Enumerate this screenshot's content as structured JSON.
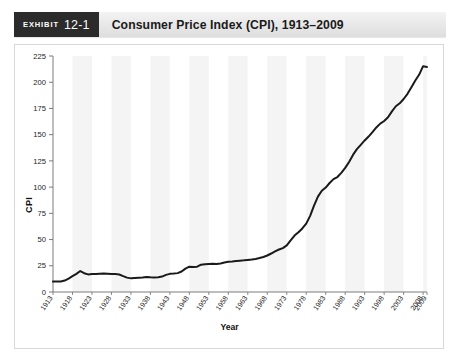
{
  "exhibit": {
    "word": "Exhibit",
    "number": "12-1"
  },
  "header": {
    "title": "Consumer Price Index (CPI), 1913–2009"
  },
  "chart_data": {
    "type": "line",
    "title": "Consumer Price Index (CPI), 1913–2009",
    "xlabel": "Year",
    "ylabel": "CPI",
    "ylim": [
      0,
      225
    ],
    "xlim": [
      1913,
      2009
    ],
    "yticks": [
      0,
      25,
      50,
      75,
      100,
      125,
      150,
      175,
      200,
      225
    ],
    "categories": [
      "1913",
      "1918",
      "1923",
      "1928",
      "1933",
      "1938",
      "1943",
      "1948",
      "1953",
      "1958",
      "1963",
      "1968",
      "1973",
      "1978",
      "1983",
      "1988",
      "1993",
      "1998",
      "2003",
      "2008",
      "2009"
    ],
    "grid": false,
    "legend": false,
    "series": [
      {
        "name": "CPI",
        "color": "#1a1a1a",
        "x": [
          1913,
          1914,
          1915,
          1916,
          1917,
          1918,
          1919,
          1920,
          1921,
          1922,
          1923,
          1924,
          1925,
          1926,
          1927,
          1928,
          1929,
          1930,
          1931,
          1932,
          1933,
          1934,
          1935,
          1936,
          1937,
          1938,
          1939,
          1940,
          1941,
          1942,
          1943,
          1944,
          1945,
          1946,
          1947,
          1948,
          1949,
          1950,
          1951,
          1952,
          1953,
          1954,
          1955,
          1956,
          1957,
          1958,
          1959,
          1960,
          1961,
          1962,
          1963,
          1964,
          1965,
          1966,
          1967,
          1968,
          1969,
          1970,
          1971,
          1972,
          1973,
          1974,
          1975,
          1976,
          1977,
          1978,
          1979,
          1980,
          1981,
          1982,
          1983,
          1984,
          1985,
          1986,
          1987,
          1988,
          1989,
          1990,
          1991,
          1992,
          1993,
          1994,
          1995,
          1996,
          1997,
          1998,
          1999,
          2000,
          2001,
          2002,
          2003,
          2004,
          2005,
          2006,
          2007,
          2008,
          2009
        ],
        "values": [
          9.9,
          10.0,
          10.1,
          10.9,
          12.8,
          15.1,
          17.3,
          20.0,
          17.9,
          16.8,
          17.1,
          17.1,
          17.5,
          17.7,
          17.4,
          17.1,
          17.1,
          16.7,
          15.2,
          13.7,
          13.0,
          13.4,
          13.7,
          13.9,
          14.4,
          14.1,
          13.9,
          14.0,
          14.7,
          16.3,
          17.3,
          17.6,
          18.0,
          19.5,
          22.3,
          24.1,
          23.8,
          24.1,
          26.0,
          26.5,
          26.7,
          26.9,
          26.8,
          27.2,
          28.1,
          28.9,
          29.1,
          29.6,
          29.9,
          30.2,
          30.6,
          31.0,
          31.5,
          32.4,
          33.4,
          34.8,
          36.7,
          38.8,
          40.5,
          41.8,
          44.4,
          49.3,
          53.8,
          56.9,
          60.6,
          65.2,
          72.6,
          82.4,
          90.9,
          96.5,
          99.6,
          103.9,
          107.6,
          109.6,
          113.6,
          118.3,
          124.0,
          130.7,
          136.2,
          140.3,
          144.5,
          148.2,
          152.4,
          156.9,
          160.5,
          163.0,
          166.6,
          172.2,
          177.1,
          179.9,
          184.0,
          188.9,
          195.3,
          201.6,
          207.3,
          215.3,
          214.5
        ]
      }
    ]
  }
}
